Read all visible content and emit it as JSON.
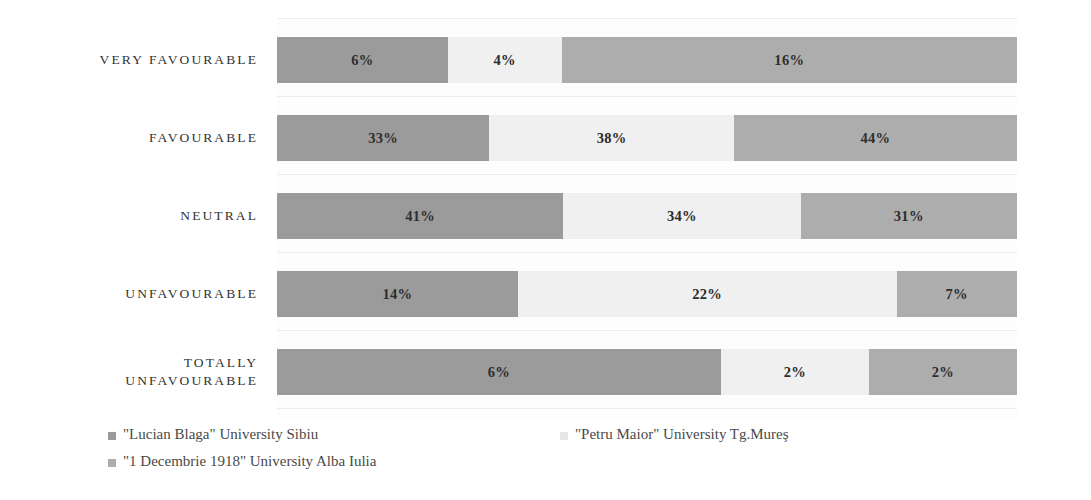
{
  "chart_data": {
    "type": "bar",
    "orientation": "horizontal",
    "stacked": true,
    "normalized": true,
    "title": "",
    "subtitle": "",
    "xlabel": "",
    "ylabel": "",
    "grid": true,
    "legend_position": "bottom-left",
    "value_format": "percent",
    "categories": [
      "VERY FAVOURABLE",
      "FAVOURABLE",
      "NEUTRAL",
      "UNFAVOURABLE",
      "TOTALLY\nUNFAVOURABLE"
    ],
    "series": [
      {
        "name": "\"Lucian Blaga\" University Sibiu",
        "color": "#9b9b9b",
        "values": [
          6,
          33,
          41,
          14,
          6
        ],
        "labels": [
          "6%",
          "33%",
          "41%",
          "14%",
          "6%"
        ]
      },
      {
        "name": "\"Petru Maior\" University Tg.Mureş",
        "color": "#f0f0f0",
        "values": [
          4,
          38,
          34,
          22,
          2
        ],
        "labels": [
          "4%",
          "38%",
          "34%",
          "22%",
          "2%"
        ]
      },
      {
        "name": "\"1 Decembrie 1918\" University Alba Iulia",
        "color": "#adadad",
        "values": [
          16,
          44,
          31,
          7,
          2
        ],
        "labels": [
          "16%",
          "44%",
          "31%",
          "7%",
          "2%"
        ]
      }
    ]
  },
  "legend": {
    "items": [
      {
        "label": "\"Lucian Blaga\" University Sibiu",
        "color": "#9b9b9b"
      },
      {
        "label": "\"Petru Maior\" University Tg.Mureş",
        "color": "#e6e6e6"
      },
      {
        "label": "\"1 Decembrie 1918\" University Alba Iulia",
        "color": "#adadad"
      }
    ]
  },
  "rows": [
    {
      "label": "VERY FAVOURABLE",
      "segments": [
        {
          "label": "6%",
          "value": 6,
          "series": "\"Lucian Blaga\" University Sibiu"
        },
        {
          "label": "4%",
          "value": 4,
          "series": "\"Petru Maior\" University Tg.Mureş"
        },
        {
          "label": "16%",
          "value": 16,
          "series": "\"1 Decembrie 1918\" University Alba Iulia"
        }
      ]
    },
    {
      "label": "FAVOURABLE",
      "segments": [
        {
          "label": "33%",
          "value": 33,
          "series": "\"Lucian Blaga\" University Sibiu"
        },
        {
          "label": "38%",
          "value": 38,
          "series": "\"Petru Maior\" University Tg.Mureş"
        },
        {
          "label": "44%",
          "value": 44,
          "series": "\"1 Decembrie 1918\" University Alba Iulia"
        }
      ]
    },
    {
      "label": "NEUTRAL",
      "segments": [
        {
          "label": "41%",
          "value": 41,
          "series": "\"Lucian Blaga\" University Sibiu"
        },
        {
          "label": "34%",
          "value": 34,
          "series": "\"Petru Maior\" University Tg.Mureş"
        },
        {
          "label": "31%",
          "value": 31,
          "series": "\"1 Decembrie 1918\" University Alba Iulia"
        }
      ]
    },
    {
      "label": "UNFAVOURABLE",
      "segments": [
        {
          "label": "14%",
          "value": 14,
          "series": "\"Lucian Blaga\" University Sibiu"
        },
        {
          "label": "22%",
          "value": 22,
          "series": "\"Petru Maior\" University Tg.Mureş"
        },
        {
          "label": "7%",
          "value": 7,
          "series": "\"1 Decembrie 1918\" University Alba Iulia"
        }
      ]
    },
    {
      "label": "TOTALLY\nUNFAVOURABLE",
      "segments": [
        {
          "label": "6%",
          "value": 6,
          "series": "\"Lucian Blaga\" University Sibiu"
        },
        {
          "label": "2%",
          "value": 2,
          "series": "\"Petru Maior\" University Tg.Mureş"
        },
        {
          "label": "2%",
          "value": 2,
          "series": "\"1 Decembrie 1918\" University Alba Iulia"
        }
      ]
    }
  ]
}
